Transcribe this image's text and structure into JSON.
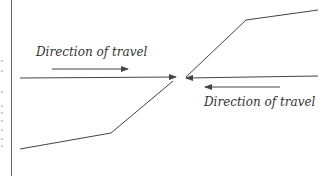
{
  "diagram": {
    "labels": {
      "left_direction": "Direction of travel",
      "right_direction": "Direction of travel"
    },
    "colors": {
      "line": "#444444",
      "text": "#333333",
      "border": "#555555"
    }
  }
}
